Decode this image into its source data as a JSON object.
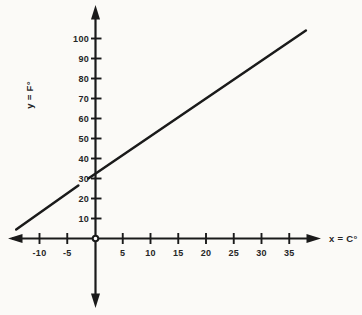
{
  "figure": {
    "background": "#fbfaf7",
    "ink": "#1a1a1a",
    "label_color": "#262626"
  },
  "chart_data": {
    "type": "line",
    "title": "",
    "xlabel": "x = C°",
    "ylabel": "y = F°",
    "xlim": [
      -15.5,
      40.5
    ],
    "ylim": [
      -34,
      116
    ],
    "x_ticks": [
      -10,
      -5,
      5,
      10,
      15,
      20,
      25,
      30,
      35
    ],
    "y_ticks": [
      10,
      20,
      30,
      40,
      50,
      60,
      70,
      80,
      90,
      100
    ],
    "grid": false,
    "legend_position": "none",
    "y_intercept": 32,
    "origin_marker": true,
    "series": [
      {
        "segments": [
          [
            [
              -14.2,
              4.5
            ],
            [
              -3.0,
              26.5
            ]
          ],
          [
            [
              -1.2,
              30.0
            ],
            [
              38.0,
              104.0
            ]
          ]
        ]
      }
    ]
  }
}
